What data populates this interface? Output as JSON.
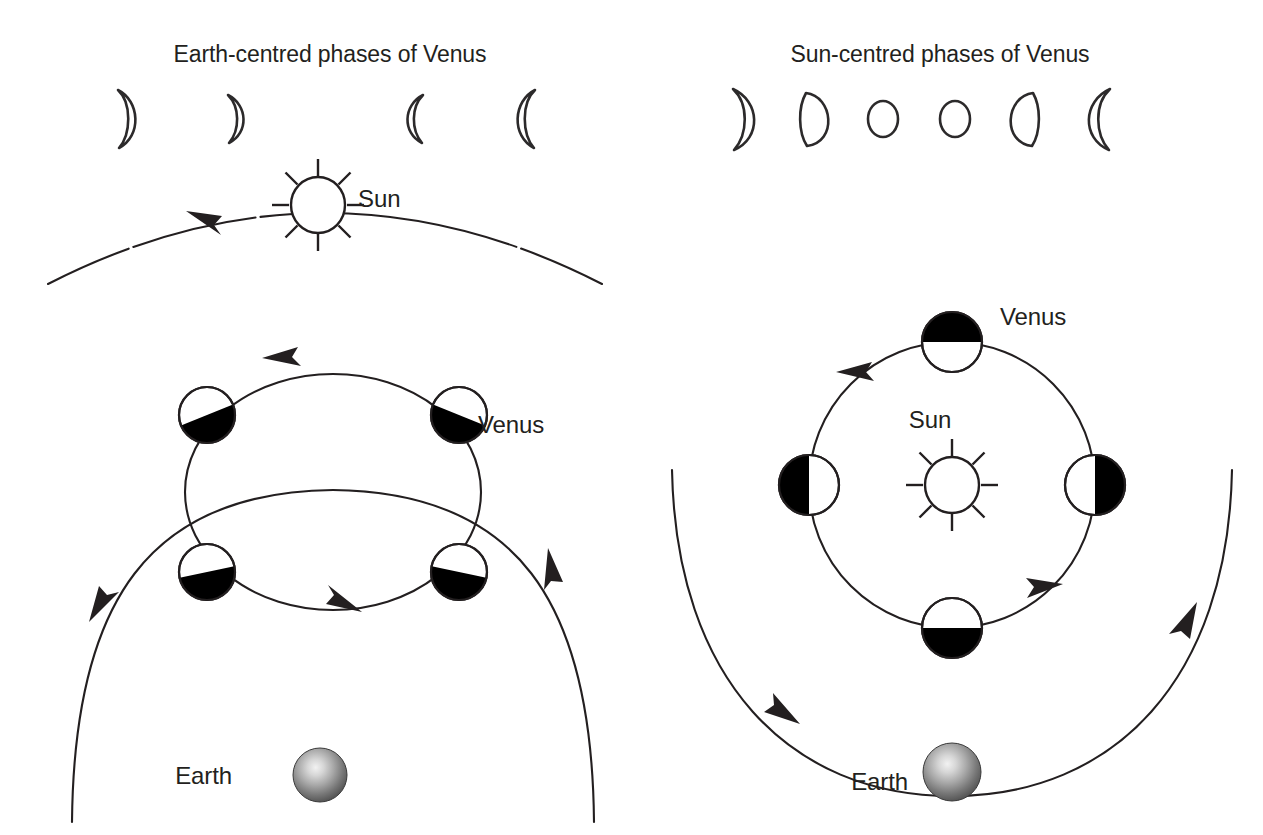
{
  "figure": {
    "kind": "astronomy-diagram",
    "caption_absent": true,
    "background_color": "#ffffff",
    "ink_color": "#231f20"
  },
  "panels": [
    {
      "id": "earth-centred",
      "title": "Earth-centred phases of Venus",
      "title_x": 330,
      "title_y": 62,
      "model": "geocentric",
      "labels": {
        "sun": "Sun",
        "venus": "Venus",
        "earth": "Earth"
      },
      "label_positions": {
        "sun": {
          "x": 358,
          "y": 207
        },
        "venus": {
          "x": 478,
          "y": 433
        },
        "earth": {
          "x": 232,
          "y": 784
        }
      },
      "phase_strip": {
        "count": 4,
        "phases": [
          {
            "name": "crescent-waxing-large",
            "lit_side": "right",
            "x": 125,
            "y": 118,
            "rx": 8,
            "ry": 30,
            "illumination": 0.16
          },
          {
            "name": "crescent-waxing-small",
            "lit_side": "right",
            "x": 234,
            "y": 118,
            "rx": 7,
            "ry": 24,
            "illumination": 0.15
          },
          {
            "name": "crescent-waning-small",
            "lit_side": "left",
            "x": 418,
            "y": 118,
            "rx": 7,
            "ry": 24,
            "illumination": 0.15
          },
          {
            "name": "crescent-waning-large",
            "lit_side": "left",
            "x": 528,
            "y": 118,
            "rx": 8,
            "ry": 30,
            "illumination": 0.16
          }
        ]
      },
      "sun": {
        "cx": 318,
        "cy": 205,
        "r": 28,
        "rays": 8,
        "ray_length": 17
      },
      "sun_orbit": {
        "description": "arc of the Sun around the Earth, arrow pointing left",
        "path": "M 48 283 Q 325 143 600 283",
        "arrow_at": {
          "x": 198,
          "y": 214,
          "angle": -155
        }
      },
      "epicycle": {
        "cx": 333,
        "cy": 492,
        "rx": 148,
        "ry": 118,
        "arrow_top": {
          "x": 281,
          "y": 347,
          "angle": -160
        },
        "arrow_bottom": {
          "x": 343,
          "y": 605,
          "angle": 18
        }
      },
      "deferent": {
        "description": "Earth-centred deferent arc carrying the epicycle, arrows on both ends",
        "path": "M 72 820 Q 90 492 333 490 Q 576 492 594 820",
        "arrow_left": {
          "x": 97,
          "y": 592,
          "angle": 108
        },
        "arrow_right": {
          "x": 541,
          "y": 560,
          "angle": -62
        }
      },
      "venus_positions": [
        {
          "name": "venus-epicycle-upper-left",
          "cx": 207,
          "cy": 415,
          "r": 28,
          "dark": "lower",
          "terminator_angle": -22
        },
        {
          "name": "venus-epicycle-upper-right",
          "cx": 459,
          "cy": 415,
          "r": 28,
          "dark": "lower",
          "terminator_angle": 22
        },
        {
          "name": "venus-epicycle-lower-left",
          "cx": 207,
          "cy": 572,
          "r": 28,
          "dark": "lower",
          "terminator_angle": -12
        },
        {
          "name": "venus-epicycle-lower-right",
          "cx": 459,
          "cy": 572,
          "r": 28,
          "dark": "lower",
          "terminator_angle": 12
        }
      ],
      "earth": {
        "cx": 320,
        "cy": 775,
        "r": 27,
        "style": "shaded-grey-sphere"
      }
    },
    {
      "id": "sun-centred",
      "title": "Sun-centred phases of Venus",
      "title_x": 940,
      "title_y": 62,
      "model": "heliocentric",
      "labels": {
        "sun": "Sun",
        "venus": "Venus",
        "earth": "Earth"
      },
      "label_positions": {
        "sun": {
          "x": 930,
          "y": 428
        },
        "venus": {
          "x": 1000,
          "y": 325
        },
        "earth": {
          "x": 872,
          "y": 790
        }
      },
      "phase_strip": {
        "count": 6,
        "phases": [
          {
            "name": "crescent-waxing-large",
            "lit_side": "right",
            "x": 740,
            "y": 118,
            "rx": 9,
            "ry": 30,
            "illumination": 0.18
          },
          {
            "name": "gibbous-waxing",
            "lit_side": "right",
            "x": 812,
            "y": 118,
            "rx": 11,
            "ry": 25,
            "illumination": 0.72
          },
          {
            "name": "full-small-a",
            "lit_side": "full",
            "x": 883,
            "y": 119,
            "rx": 15,
            "ry": 18,
            "illumination": 1.0
          },
          {
            "name": "full-small-b",
            "lit_side": "full",
            "x": 955,
            "y": 119,
            "rx": 15,
            "ry": 18,
            "illumination": 1.0
          },
          {
            "name": "gibbous-waning",
            "lit_side": "left",
            "x": 1027,
            "y": 118,
            "rx": 11,
            "ry": 25,
            "illumination": 0.72
          },
          {
            "name": "crescent-waning-large",
            "lit_side": "left",
            "x": 1103,
            "y": 118,
            "rx": 9,
            "ry": 30,
            "illumination": 0.18
          }
        ]
      },
      "sun": {
        "cx": 952,
        "cy": 485,
        "r": 28,
        "rays": 8,
        "ray_length": 17
      },
      "venus_orbit": {
        "description": "circular orbit of Venus around the Sun, counter-clockwise arrows",
        "cx": 952,
        "cy": 485,
        "r": 143,
        "arrow_upper_left": {
          "x": 862,
          "y": 372,
          "angle": -140
        },
        "arrow_lower_right": {
          "x": 1036,
          "y": 594,
          "angle": -50
        }
      },
      "earth_orbit": {
        "description": "outer orbit of the Earth around the Sun, two arrows",
        "path": "M 672 470 Q 678 800 952 796 Q 1226 800 1232 470",
        "arrow_left": {
          "x": 778,
          "y": 712,
          "angle": 62
        },
        "arrow_right": {
          "x": 1185,
          "y": 640,
          "angle": -72
        }
      },
      "venus_positions": [
        {
          "name": "venus-orbit-top",
          "cx": 952,
          "cy": 342,
          "r": 30,
          "dark": "upper",
          "terminator_angle": 0
        },
        {
          "name": "venus-orbit-right",
          "cx": 1095,
          "cy": 485,
          "r": 30,
          "dark": "right",
          "terminator_angle": 90
        },
        {
          "name": "venus-orbit-bottom",
          "cx": 952,
          "cy": 628,
          "r": 30,
          "dark": "lower",
          "terminator_angle": 0
        },
        {
          "name": "venus-orbit-left",
          "cx": 809,
          "cy": 485,
          "r": 30,
          "dark": "left",
          "terminator_angle": 90
        }
      ],
      "earth": {
        "cx": 952,
        "cy": 772,
        "r": 29,
        "style": "shaded-grey-sphere"
      }
    }
  ]
}
